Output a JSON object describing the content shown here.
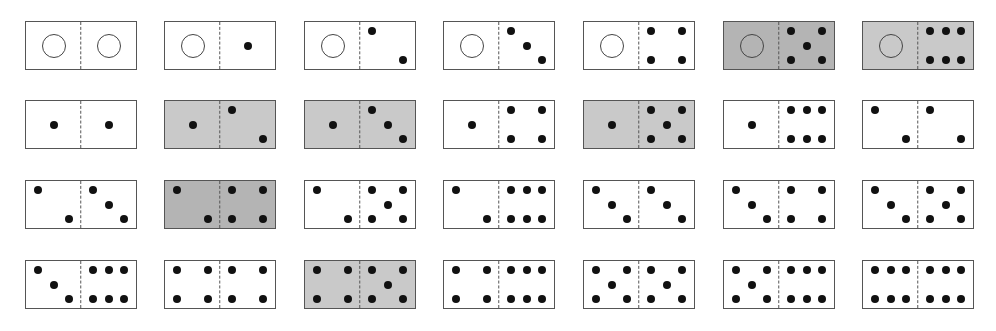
{
  "layout": {
    "col_x": [
      25,
      164,
      304,
      443,
      583,
      723,
      862
    ],
    "row_y": [
      21,
      100,
      180,
      260
    ]
  },
  "colors": {
    "white": "#ffffff",
    "shade_dark": "#b4b4b4",
    "shade_light": "#c9c9c9",
    "border": "#555555",
    "pip": "#111111"
  },
  "dominoes": [
    {
      "row": 0,
      "col": 0,
      "left": 0,
      "right": 0,
      "shade": "white"
    },
    {
      "row": 0,
      "col": 1,
      "left": 0,
      "right": 1,
      "shade": "white"
    },
    {
      "row": 0,
      "col": 2,
      "left": 0,
      "right": 2,
      "shade": "white"
    },
    {
      "row": 0,
      "col": 3,
      "left": 0,
      "right": 3,
      "shade": "white"
    },
    {
      "row": 0,
      "col": 4,
      "left": 0,
      "right": 4,
      "shade": "white"
    },
    {
      "row": 0,
      "col": 5,
      "left": 0,
      "right": 5,
      "shade": "shade_dark"
    },
    {
      "row": 0,
      "col": 6,
      "left": 0,
      "right": 6,
      "shade": "shade_light"
    },
    {
      "row": 1,
      "col": 0,
      "left": 1,
      "right": 1,
      "shade": "white"
    },
    {
      "row": 1,
      "col": 1,
      "left": 1,
      "right": 2,
      "shade": "shade_light"
    },
    {
      "row": 1,
      "col": 2,
      "left": 1,
      "right": 3,
      "shade": "shade_light"
    },
    {
      "row": 1,
      "col": 3,
      "left": 1,
      "right": 4,
      "shade": "white"
    },
    {
      "row": 1,
      "col": 4,
      "left": 1,
      "right": 5,
      "shade": "shade_light"
    },
    {
      "row": 1,
      "col": 5,
      "left": 1,
      "right": 6,
      "shade": "white"
    },
    {
      "row": 1,
      "col": 6,
      "left": 2,
      "right": 2,
      "shade": "white"
    },
    {
      "row": 2,
      "col": 0,
      "left": 2,
      "right": 3,
      "shade": "white"
    },
    {
      "row": 2,
      "col": 1,
      "left": 2,
      "right": 4,
      "shade": "shade_dark"
    },
    {
      "row": 2,
      "col": 2,
      "left": 2,
      "right": 5,
      "shade": "white"
    },
    {
      "row": 2,
      "col": 3,
      "left": 2,
      "right": 6,
      "shade": "white"
    },
    {
      "row": 2,
      "col": 4,
      "left": 3,
      "right": 3,
      "shade": "white"
    },
    {
      "row": 2,
      "col": 5,
      "left": 3,
      "right": 4,
      "shade": "white"
    },
    {
      "row": 2,
      "col": 6,
      "left": 3,
      "right": 5,
      "shade": "white"
    },
    {
      "row": 3,
      "col": 0,
      "left": 3,
      "right": 6,
      "shade": "white"
    },
    {
      "row": 3,
      "col": 1,
      "left": 4,
      "right": 4,
      "shade": "white"
    },
    {
      "row": 3,
      "col": 2,
      "left": 4,
      "right": 5,
      "shade": "shade_light"
    },
    {
      "row": 3,
      "col": 3,
      "left": 4,
      "right": 6,
      "shade": "white"
    },
    {
      "row": 3,
      "col": 4,
      "left": 5,
      "right": 5,
      "shade": "white"
    },
    {
      "row": 3,
      "col": 5,
      "left": 5,
      "right": 6,
      "shade": "white"
    },
    {
      "row": 3,
      "col": 6,
      "left": 6,
      "right": 6,
      "shade": "white"
    }
  ],
  "pip_positions": {
    "0": [],
    "1": [
      [
        50,
        50
      ]
    ],
    "2": [
      [
        22,
        20
      ],
      [
        78,
        80
      ]
    ],
    "3": [
      [
        22,
        20
      ],
      [
        50,
        50
      ],
      [
        78,
        80
      ]
    ],
    "4": [
      [
        22,
        20
      ],
      [
        78,
        20
      ],
      [
        22,
        80
      ],
      [
        78,
        80
      ]
    ],
    "5": [
      [
        22,
        20
      ],
      [
        78,
        20
      ],
      [
        50,
        50
      ],
      [
        22,
        80
      ],
      [
        78,
        80
      ]
    ],
    "6": [
      [
        22,
        20
      ],
      [
        50,
        20
      ],
      [
        78,
        20
      ],
      [
        22,
        80
      ],
      [
        50,
        80
      ],
      [
        78,
        80
      ]
    ]
  }
}
